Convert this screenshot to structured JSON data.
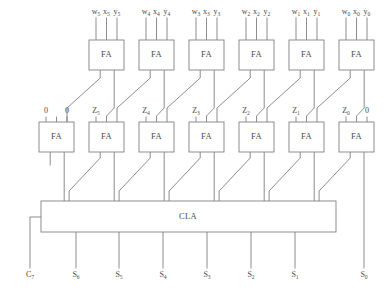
{
  "diagram": {
    "stroke_color": "#808080",
    "text_color": "#4a4a4a",
    "background": "#ffffff",
    "block_label_fa": "FA",
    "block_label_cla": "CLA",
    "top_row": {
      "count": 6,
      "box_width": 35,
      "box_height": 30,
      "box_y": 40,
      "pitch": 50,
      "first_box_x": 89,
      "columns": [
        {
          "index": 5,
          "box_x": 89,
          "inputs": [
            {
              "base": "w",
              "sub": "5"
            },
            {
              "base": "x",
              "sub": "5"
            },
            {
              "base": "y",
              "sub": "5"
            }
          ]
        },
        {
          "index": 4,
          "box_x": 139,
          "inputs": [
            {
              "base": "w",
              "sub": "4"
            },
            {
              "base": "x",
              "sub": "4"
            },
            {
              "base": "y",
              "sub": "4"
            }
          ]
        },
        {
          "index": 3,
          "box_x": 189,
          "inputs": [
            {
              "base": "w",
              "sub": "3"
            },
            {
              "base": "x",
              "sub": "3"
            },
            {
              "base": "y",
              "sub": "3"
            }
          ]
        },
        {
          "index": 2,
          "box_x": 239,
          "inputs": [
            {
              "base": "w",
              "sub": "2"
            },
            {
              "base": "x",
              "sub": "2"
            },
            {
              "base": "y",
              "sub": "2"
            }
          ]
        },
        {
          "index": 1,
          "box_x": 289,
          "inputs": [
            {
              "base": "w",
              "sub": "1"
            },
            {
              "base": "x",
              "sub": "1"
            },
            {
              "base": "y",
              "sub": "1"
            }
          ]
        },
        {
          "index": 0,
          "box_x": 339,
          "inputs": [
            {
              "base": "w",
              "sub": "0"
            },
            {
              "base": "x",
              "sub": "0"
            },
            {
              "base": "y",
              "sub": "0"
            }
          ]
        }
      ],
      "input_label_y": 14,
      "input_stub_top": 18
    },
    "second_row": {
      "count": 7,
      "box_width": 35,
      "box_height": 30,
      "box_y": 122,
      "pitch": 50,
      "first_box_x": 39,
      "label_y": 113,
      "boxes": [
        {
          "box_x": 39,
          "left_label": {
            "base": "0",
            "sub": ""
          },
          "right_label": {
            "base": "0",
            "sub": ""
          }
        },
        {
          "box_x": 89,
          "left_label": {
            "base": "Z",
            "sub": "5"
          },
          "right_label": null
        },
        {
          "box_x": 139,
          "left_label": {
            "base": "Z",
            "sub": "4"
          },
          "right_label": null
        },
        {
          "box_x": 189,
          "left_label": {
            "base": "Z",
            "sub": "3"
          },
          "right_label": null
        },
        {
          "box_x": 239,
          "left_label": {
            "base": "Z",
            "sub": "2"
          },
          "right_label": null
        },
        {
          "box_x": 289,
          "left_label": {
            "base": "Z",
            "sub": "1"
          },
          "right_label": null
        },
        {
          "box_x": 339,
          "left_label": {
            "base": "Z",
            "sub": "0"
          },
          "right_label": {
            "base": "0",
            "sub": ""
          }
        }
      ]
    },
    "cla": {
      "x": 41,
      "y": 201,
      "width": 295,
      "height": 31,
      "label": "CLA",
      "label_x": 188,
      "label_y": 217
    },
    "outputs": {
      "label_y": 277,
      "items": [
        {
          "base": "C",
          "sub": "7",
          "x": 30,
          "line_top": 232,
          "line_bottom": 268,
          "from": "cla-carry-out"
        },
        {
          "base": "S",
          "sub": "6",
          "x": 76,
          "line_top": 232,
          "line_bottom": 268,
          "from": "cla"
        },
        {
          "base": "S",
          "sub": "5",
          "x": 119,
          "line_top": 232,
          "line_bottom": 268,
          "from": "cla"
        },
        {
          "base": "S",
          "sub": "4",
          "x": 163,
          "line_top": 232,
          "line_bottom": 268,
          "from": "cla"
        },
        {
          "base": "S",
          "sub": "3",
          "x": 207,
          "line_top": 232,
          "line_bottom": 268,
          "from": "cla"
        },
        {
          "base": "S",
          "sub": "2",
          "x": 251,
          "line_top": 232,
          "line_bottom": 268,
          "from": "cla"
        },
        {
          "base": "S",
          "sub": "1",
          "x": 295,
          "line_top": 232,
          "line_bottom": 268,
          "from": "cla"
        },
        {
          "base": "S",
          "sub": "0",
          "x": 364,
          "line_top": 152,
          "line_bottom": 268,
          "from": "fa0-sum"
        }
      ]
    }
  }
}
